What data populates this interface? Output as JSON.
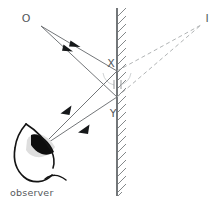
{
  "figure": {
    "labels": {
      "object": "O",
      "image": "I",
      "point_x": "X",
      "point_y": "Y",
      "observer": "observer"
    },
    "colors": {
      "ray": "#6b6f72",
      "ray_dark": "#4a4e51",
      "dashed_ray": "#a8abad",
      "mirror": "#5a5e61",
      "hatching": "#6e7275",
      "eye_outline": "#1a1a1a",
      "pupil": "#101010",
      "iris_shade": "#d9d9d9",
      "text": "#55595c",
      "background": "#ffffff"
    },
    "geometry": {
      "mirror": {
        "x": 117,
        "y_top": 8,
        "y_bottom": 196
      },
      "object_point": {
        "x": 40,
        "y": 24
      },
      "image_point": {
        "x": 202,
        "y": 24
      },
      "point_x": {
        "x": 117,
        "y": 71
      },
      "point_y": {
        "x": 117,
        "y": 97
      },
      "eye_point": {
        "x": 40,
        "y": 148
      },
      "incident_arrow_1": {
        "x": 76,
        "y": 46
      },
      "incident_arrow_2": {
        "x": 70,
        "y": 54
      },
      "reflected_arrow_1": {
        "x": 66,
        "y": 111
      },
      "reflected_arrow_2": {
        "x": 84,
        "y": 129
      }
    },
    "annotations": {
      "angle_arc_x": "angle-of-incidence-arc",
      "angle_arc_y": "angle-of-reflection-arc",
      "normal_tick": "normal-tick-mark"
    },
    "icon_names": {
      "mirror": "mirror-surface-icon",
      "eye": "eye-icon",
      "arrowhead": "ray-arrowhead-icon"
    }
  }
}
